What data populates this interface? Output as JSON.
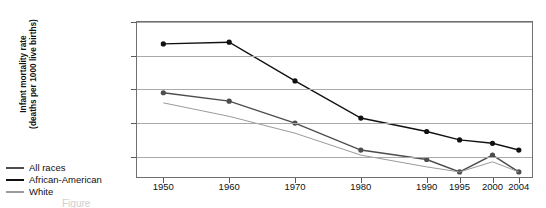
{
  "chart_data": {
    "type": "line",
    "title": "",
    "xlabel": "",
    "ylabel": "Infant mortality rate (deaths per 1000 live births)",
    "ylabel_line1": "Infant mortality rate",
    "ylabel_line2": "(deaths per 1000 live births)",
    "categories": [
      "1950",
      "1960",
      "1970",
      "1980",
      "1990",
      "1995",
      "2000",
      "2004"
    ],
    "x": [
      1950,
      1960,
      1970,
      1980,
      1990,
      1995,
      2000,
      2004
    ],
    "xlim": [
      1946,
      2006
    ],
    "ylim": [
      4,
      50
    ],
    "yticks": [
      10,
      20,
      30,
      40,
      50
    ],
    "xticks": [
      "1950",
      "1960",
      "1970",
      "1980",
      "1990",
      "1995",
      "2000",
      "2004"
    ],
    "grid": true,
    "grid_axis": "y",
    "legend_position": "outside-bottom-left",
    "markers": "filled-circle",
    "series": [
      {
        "name": "All races",
        "color": "#4d4d4d",
        "values": [
          29.0,
          26.5,
          20.0,
          12.0,
          9.2,
          5.5,
          10.5,
          5.5
        ]
      },
      {
        "name": "African-American",
        "color": "#111111",
        "values": [
          43.5,
          44.0,
          32.5,
          21.5,
          17.5,
          15.0,
          14.0,
          12.0
        ]
      },
      {
        "name": "White",
        "color": "#9a9a9a",
        "values": [
          26.0,
          22.0,
          17.0,
          10.5,
          7.0,
          5.5,
          8.5,
          5.5
        ]
      }
    ]
  },
  "legend": {
    "items": [
      {
        "label": "All races",
        "color": "#4d4d4d"
      },
      {
        "label": "African-American",
        "color": "#111111"
      },
      {
        "label": "White",
        "color": "#9a9a9a"
      }
    ]
  },
  "axis": {
    "y_tick_labels": [
      "10",
      "20",
      "30",
      "40",
      "50"
    ],
    "x_tick_labels": [
      "1950",
      "1960",
      "1970",
      "1980",
      "1990",
      "1995",
      "2000",
      "2004"
    ]
  },
  "caption": {
    "text": "Figure"
  },
  "colors": {
    "frame": "#6f6f6f",
    "gridline": "#a9a9a9",
    "text": "#111111",
    "background": "#ffffff"
  }
}
